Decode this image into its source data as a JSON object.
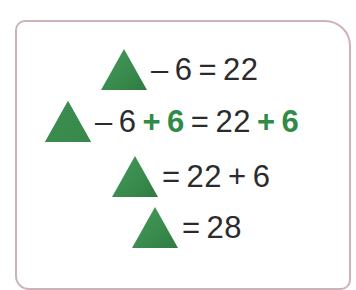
{
  "card": {
    "name": "worksheet-card",
    "border_color": "#cbb3b7",
    "background": "#ffffff"
  },
  "colors": {
    "triangle_green": "#3a8c4e",
    "triangle_green_dark": "#2f7a41",
    "highlight_green": "#2f8b45",
    "text_black": "#2b2b2b",
    "frame_mauve": "#cbb3b7"
  },
  "symbols": {
    "triangle": "green-triangle",
    "minus": "–",
    "plus": "+",
    "equals": "="
  },
  "equations": [
    {
      "id": "equation-1",
      "shape": "green-triangle",
      "tokens": [
        {
          "text": "–",
          "style": "black"
        },
        {
          "text": "6",
          "style": "black"
        },
        {
          "text": "=",
          "style": "black"
        },
        {
          "text": "22",
          "style": "black"
        }
      ],
      "plain": "▲ – 6 = 22"
    },
    {
      "id": "equation-2",
      "shape": "green-triangle",
      "tokens": [
        {
          "text": "–",
          "style": "black"
        },
        {
          "text": "6",
          "style": "black"
        },
        {
          "text": "+",
          "style": "green"
        },
        {
          "text": "6",
          "style": "green"
        },
        {
          "text": "=",
          "style": "black"
        },
        {
          "text": "22",
          "style": "black"
        },
        {
          "text": "+",
          "style": "green"
        },
        {
          "text": "6",
          "style": "green"
        }
      ],
      "plain": "▲ – 6 + 6 = 22 + 6"
    },
    {
      "id": "equation-3",
      "shape": "green-triangle",
      "tokens": [
        {
          "text": "=",
          "style": "black"
        },
        {
          "text": "22",
          "style": "black"
        },
        {
          "text": "+",
          "style": "black"
        },
        {
          "text": "6",
          "style": "black"
        }
      ],
      "plain": "▲ = 22 + 6"
    },
    {
      "id": "equation-4",
      "shape": "green-triangle",
      "tokens": [
        {
          "text": "=",
          "style": "black"
        },
        {
          "text": "28",
          "style": "black"
        }
      ],
      "plain": "▲ = 28"
    }
  ]
}
